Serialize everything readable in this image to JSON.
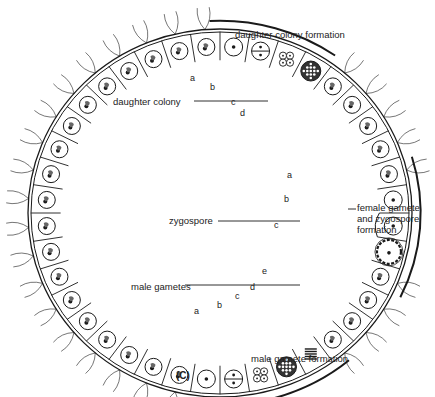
{
  "figure": {
    "panel_label": "(C)",
    "center": [
      220,
      213
    ],
    "rx_outer": 192,
    "ry_outer": 184,
    "cell_count": 40
  },
  "labels": {
    "daughter_colony_formation": "daughter colony formation",
    "daughter_colony": "daughter colony",
    "female_gamete_formation": [
      "female gamete",
      "and zygospore",
      "formation"
    ],
    "zygospore": "zygospore",
    "male_gametes": "male gametes",
    "male_gamete_formation": "male gamete formation"
  },
  "stage_letters": {
    "daughter": [
      {
        "t": "a",
        "x": 190,
        "y": 79
      },
      {
        "t": "b",
        "x": 210,
        "y": 88
      },
      {
        "t": "c",
        "x": 231,
        "y": 103
      },
      {
        "t": "d",
        "x": 240,
        "y": 114
      }
    ],
    "female": [
      {
        "t": "a",
        "x": 287,
        "y": 176
      },
      {
        "t": "b",
        "x": 284,
        "y": 200
      },
      {
        "t": "c",
        "x": 274,
        "y": 226
      }
    ],
    "male": [
      {
        "t": "a",
        "x": 194,
        "y": 312
      },
      {
        "t": "b",
        "x": 217,
        "y": 306
      },
      {
        "t": "c",
        "x": 235,
        "y": 297
      },
      {
        "t": "d",
        "x": 250,
        "y": 288
      },
      {
        "t": "e",
        "x": 262,
        "y": 272
      }
    ]
  },
  "colors": {
    "ink": "#1a1a1a",
    "background": "#ffffff"
  }
}
